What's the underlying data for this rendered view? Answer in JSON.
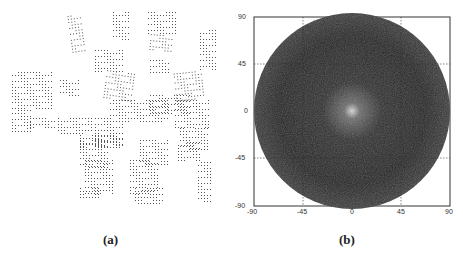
{
  "figure": {
    "panels": [
      {
        "id": "a",
        "label": "(a)",
        "description": "scattered dotted rectangular array tiles"
      },
      {
        "id": "b",
        "label": "(b)",
        "description": "circular far-field radiation pattern, dark noisy disc with bright center"
      }
    ]
  },
  "chart_data": [
    {
      "type": "heatmap",
      "panel": "(b)",
      "title": "",
      "xlabel": "",
      "ylabel": "",
      "xlim": [
        -90,
        90
      ],
      "ylim": [
        -90,
        90
      ],
      "x_ticks": [
        "-90",
        "-45",
        "0",
        "45",
        "90"
      ],
      "y_ticks": [
        "90",
        "45",
        "0",
        "-45",
        "-90"
      ],
      "grid": "dotted at ±45",
      "content": "dark circular region radius 90 with noisy grey speckle, brighter peak at center (0,0)"
    }
  ]
}
